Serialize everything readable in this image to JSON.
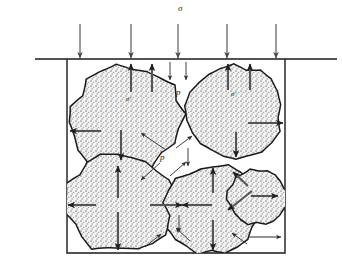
{
  "figure": {
    "type": "diagram",
    "width": 342,
    "height": 270,
    "background_color": "#ffffff",
    "line_color": "#1a1a1a",
    "arrow_color": "#555555",
    "grain_fill": "#f2f2f2",
    "stipple_color": "#9a9a9a"
  },
  "labels": {
    "total_stress": "σ",
    "pore_pressure_top": "p",
    "pore_pressure_mid": "p",
    "effective_stress_left": "σ′",
    "effective_stress_right": "σ′"
  },
  "label_positions": {
    "total_stress": {
      "x": 178,
      "y": 4
    },
    "pore_pressure_top": {
      "x": 176,
      "y": 88
    },
    "pore_pressure_mid": {
      "x": 160,
      "y": 153
    },
    "effective_stress_left": {
      "x": 126,
      "y": 96
    },
    "effective_stress_right": {
      "x": 231,
      "y": 91
    }
  },
  "geometry": {
    "ground_line": {
      "x1": 35,
      "y1": 59,
      "x2": 337,
      "y2": 59
    },
    "box": {
      "left": 67,
      "right": 285,
      "top": 59,
      "bottom": 253
    }
  },
  "applied_load_arrows": [
    {
      "x": 80,
      "y1": 24,
      "y2": 58
    },
    {
      "x": 131,
      "y1": 24,
      "y2": 58
    },
    {
      "x": 178,
      "y1": 24,
      "y2": 58
    },
    {
      "x": 227,
      "y1": 24,
      "y2": 58
    },
    {
      "x": 276,
      "y1": 24,
      "y2": 58
    }
  ],
  "pore_pressure_arrows": [
    {
      "x": 170,
      "y1": 62,
      "y2": 80
    },
    {
      "x": 186,
      "y1": 62,
      "y2": 80
    },
    {
      "x": 188,
      "y1": 148,
      "y2": 166
    },
    {
      "x": 179,
      "y1": 215,
      "y2": 232
    }
  ],
  "grains": [
    {
      "name": "grain-upper-left",
      "cx": 126,
      "cy": 118,
      "rx": 57,
      "ry": 52,
      "rot": -18
    },
    {
      "name": "grain-upper-right",
      "cx": 235,
      "cy": 112,
      "rx": 48,
      "ry": 48,
      "rot": 8
    },
    {
      "name": "grain-lower-left",
      "cx": 120,
      "cy": 203,
      "rx": 55,
      "ry": 50,
      "rot": 6
    },
    {
      "name": "grain-lower-middle",
      "cx": 213,
      "cy": 210,
      "rx": 48,
      "ry": 45,
      "rot": -6
    },
    {
      "name": "grain-lower-right",
      "cx": 258,
      "cy": 197,
      "rx": 31,
      "ry": 28,
      "rot": 12
    }
  ],
  "contact_force_arrows": [
    {
      "name": "contact-ul-top-a",
      "x1": 131,
      "y1": 92,
      "x2": 131,
      "y2": 64
    },
    {
      "name": "contact-ul-top-b",
      "x1": 152,
      "y1": 92,
      "x2": 152,
      "y2": 64
    },
    {
      "name": "contact-ul-left",
      "x1": 101,
      "y1": 131,
      "x2": 70,
      "y2": 131
    },
    {
      "name": "contact-ul-bottom",
      "x1": 121,
      "y1": 130,
      "x2": 121,
      "y2": 160
    },
    {
      "name": "contact-ur-top-a",
      "x1": 228,
      "y1": 90,
      "x2": 228,
      "y2": 64
    },
    {
      "name": "contact-ur-top-b",
      "x1": 250,
      "y1": 90,
      "x2": 250,
      "y2": 64
    },
    {
      "name": "contact-ur-right",
      "x1": 248,
      "y1": 123,
      "x2": 283,
      "y2": 123
    },
    {
      "name": "contact-ur-bottom",
      "x1": 236,
      "y1": 132,
      "x2": 236,
      "y2": 157
    },
    {
      "name": "contact-ll-top",
      "x1": 118,
      "y1": 198,
      "x2": 118,
      "y2": 166
    },
    {
      "name": "contact-ll-left",
      "x1": 96,
      "y1": 205,
      "x2": 68,
      "y2": 205
    },
    {
      "name": "contact-ll-right",
      "x1": 150,
      "y1": 205,
      "x2": 182,
      "y2": 205
    },
    {
      "name": "contact-ll-bottom",
      "x1": 118,
      "y1": 212,
      "x2": 118,
      "y2": 250
    },
    {
      "name": "contact-lm-left",
      "x1": 212,
      "y1": 205,
      "x2": 182,
      "y2": 205
    },
    {
      "name": "contact-lm-top",
      "x1": 213,
      "y1": 193,
      "x2": 213,
      "y2": 168
    },
    {
      "name": "contact-lm-bottom",
      "x1": 213,
      "y1": 220,
      "x2": 213,
      "y2": 250
    },
    {
      "name": "contact-lr-right",
      "x1": 251,
      "y1": 196,
      "x2": 278,
      "y2": 196
    },
    {
      "name": "contact-lr-diag-down",
      "x1": 252,
      "y1": 191,
      "x2": 228,
      "y2": 210
    },
    {
      "name": "contact-lr-diag-up",
      "x1": 248,
      "y1": 186,
      "x2": 233,
      "y2": 172
    }
  ],
  "leader_lines": [
    {
      "name": "leader-p-to-void-upper",
      "x1": 166,
      "y1": 150,
      "x2": 141,
      "y2": 133
    },
    {
      "name": "leader-p-to-void-right",
      "x1": 176,
      "y1": 148,
      "x2": 192,
      "y2": 136
    },
    {
      "name": "leader-p-to-void-lower",
      "x1": 160,
      "y1": 163,
      "x2": 141,
      "y2": 180
    },
    {
      "name": "leader-void-lower-a",
      "x1": 170,
      "y1": 176,
      "x2": 186,
      "y2": 162
    },
    {
      "name": "leader-void-bottom-a",
      "x1": 145,
      "y1": 247,
      "x2": 161,
      "y2": 234
    },
    {
      "name": "leader-void-bottom-b",
      "x1": 190,
      "y1": 241,
      "x2": 176,
      "y2": 228
    },
    {
      "name": "leader-void-bottom-c",
      "x1": 247,
      "y1": 244,
      "x2": 232,
      "y2": 233
    }
  ],
  "boundary_arrow": {
    "name": "lateral-boundary-arrow",
    "x1": 248,
    "y1": 237,
    "x2": 281,
    "y2": 237
  }
}
